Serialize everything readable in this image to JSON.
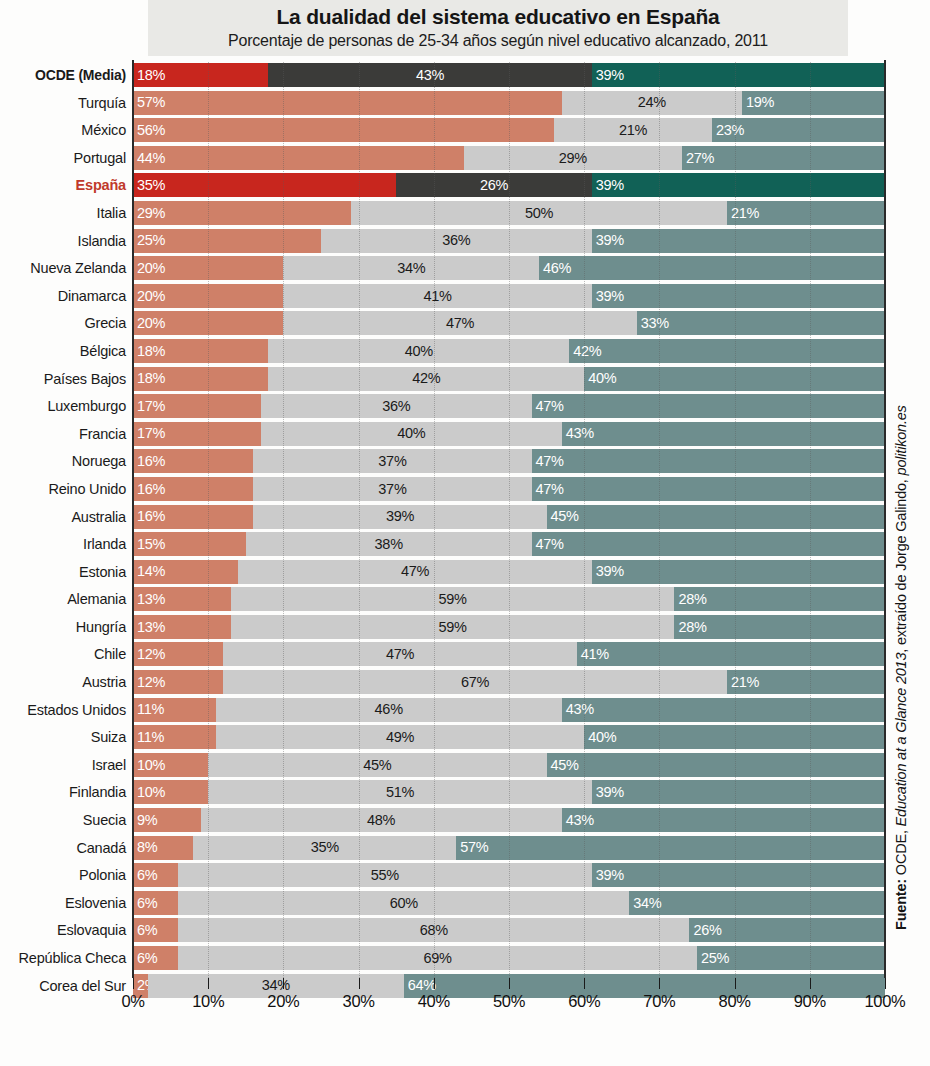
{
  "header": {
    "title": "La dualidad del sistema educativo en España",
    "subtitle": "Porcentaje de personas de 25-34 años según nivel educativo alcanzado, 2011"
  },
  "source": {
    "prefix": "Fuente:",
    "org": "OCDE,",
    "publication": "Education at a Glance 2013",
    "middle": ", extraído de Jorge Galindo,",
    "site": "politikon.es"
  },
  "axis": {
    "ticks": [
      "0%",
      "10%",
      "20%",
      "30%",
      "40%",
      "50%",
      "60%",
      "70%",
      "80%",
      "90%",
      "100%"
    ],
    "min": 0,
    "max": 100
  },
  "colors": {
    "seg1_normal": "#cf8068",
    "seg2_normal": "#cbcbcb",
    "seg3_normal": "#6e8e8e",
    "seg1_highlight": "#c8261e",
    "seg2_highlight": "#3b3b39",
    "seg3_highlight": "#116156",
    "spain_label": "#c0392b",
    "title_band": "#e9e9e6"
  },
  "chart_data": {
    "type": "bar",
    "orientation": "horizontal",
    "stacked": true,
    "title": "La dualidad del sistema educativo en España",
    "subtitle": "Porcentaje de personas de 25-34 años según nivel educativo alcanzado, 2011",
    "xlabel": "",
    "ylabel": "",
    "xlim": [
      0,
      100
    ],
    "grid": true,
    "legend": null,
    "series": [
      {
        "name": "Por debajo de secundaria",
        "color": "#cf8068"
      },
      {
        "name": "Secundaria",
        "color": "#cbcbcb"
      },
      {
        "name": "Terciaria",
        "color": "#6e8e8e"
      }
    ],
    "categories": [
      "OCDE (Media)",
      "Turquía",
      "México",
      "Portugal",
      "España",
      "Italia",
      "Islandia",
      "Nueva Zelanda",
      "Dinamarca",
      "Grecia",
      "Bélgica",
      "Países Bajos",
      "Luxemburgo",
      "Francia",
      "Noruega",
      "Reino Unido",
      "Australia",
      "Irlanda",
      "Estonia",
      "Alemania",
      "Hungría",
      "Chile",
      "Austria",
      "Estados Unidos",
      "Suiza",
      "Israel",
      "Finlandia",
      "Suecia",
      "Canadá",
      "Polonia",
      "Eslovenia",
      "Eslovaquia",
      "República Checa",
      "Corea del Sur"
    ],
    "rows": [
      {
        "label": "OCDE (Media)",
        "style": "bold",
        "highlight": true,
        "values": [
          18,
          43,
          39
        ],
        "labels": [
          "18%",
          "43%",
          "39%"
        ]
      },
      {
        "label": "Turquía",
        "style": "normal",
        "highlight": false,
        "values": [
          57,
          24,
          19
        ],
        "labels": [
          "57%",
          "24%",
          "19%"
        ]
      },
      {
        "label": "México",
        "style": "normal",
        "highlight": false,
        "values": [
          56,
          21,
          23
        ],
        "labels": [
          "56%",
          "21%",
          "23%"
        ]
      },
      {
        "label": "Portugal",
        "style": "normal",
        "highlight": false,
        "values": [
          44,
          29,
          27
        ],
        "labels": [
          "44%",
          "29%",
          "27%"
        ]
      },
      {
        "label": "España",
        "style": "spain",
        "highlight": true,
        "values": [
          35,
          26,
          39
        ],
        "labels": [
          "35%",
          "26%",
          "39%"
        ]
      },
      {
        "label": "Italia",
        "style": "normal",
        "highlight": false,
        "values": [
          29,
          50,
          21
        ],
        "labels": [
          "29%",
          "50%",
          "21%"
        ]
      },
      {
        "label": "Islandia",
        "style": "normal",
        "highlight": false,
        "values": [
          25,
          36,
          39
        ],
        "labels": [
          "25%",
          "36%",
          "39%"
        ]
      },
      {
        "label": "Nueva Zelanda",
        "style": "normal",
        "highlight": false,
        "values": [
          20,
          34,
          46
        ],
        "labels": [
          "20%",
          "34%",
          "46%"
        ]
      },
      {
        "label": "Dinamarca",
        "style": "normal",
        "highlight": false,
        "values": [
          20,
          41,
          39
        ],
        "labels": [
          "20%",
          "41%",
          "39%"
        ]
      },
      {
        "label": "Grecia",
        "style": "normal",
        "highlight": false,
        "values": [
          20,
          47,
          33
        ],
        "labels": [
          "20%",
          "47%",
          "33%"
        ]
      },
      {
        "label": "Bélgica",
        "style": "normal",
        "highlight": false,
        "values": [
          18,
          40,
          42
        ],
        "labels": [
          "18%",
          "40%",
          "42%"
        ]
      },
      {
        "label": "Países Bajos",
        "style": "normal",
        "highlight": false,
        "values": [
          18,
          42,
          40
        ],
        "labels": [
          "18%",
          "42%",
          "40%"
        ]
      },
      {
        "label": "Luxemburgo",
        "style": "normal",
        "highlight": false,
        "values": [
          17,
          36,
          47
        ],
        "labels": [
          "17%",
          "36%",
          "47%"
        ]
      },
      {
        "label": "Francia",
        "style": "normal",
        "highlight": false,
        "values": [
          17,
          40,
          43
        ],
        "labels": [
          "17%",
          "40%",
          "43%"
        ]
      },
      {
        "label": "Noruega",
        "style": "normal",
        "highlight": false,
        "values": [
          16,
          37,
          47
        ],
        "labels": [
          "16%",
          "37%",
          "47%"
        ]
      },
      {
        "label": "Reino Unido",
        "style": "normal",
        "highlight": false,
        "values": [
          16,
          37,
          47
        ],
        "labels": [
          "16%",
          "37%",
          "47%"
        ]
      },
      {
        "label": "Australia",
        "style": "normal",
        "highlight": false,
        "values": [
          16,
          39,
          45
        ],
        "labels": [
          "16%",
          "39%",
          "45%"
        ]
      },
      {
        "label": "Irlanda",
        "style": "normal",
        "highlight": false,
        "values": [
          15,
          38,
          47
        ],
        "labels": [
          "15%",
          "38%",
          "47%"
        ]
      },
      {
        "label": "Estonia",
        "style": "normal",
        "highlight": false,
        "values": [
          14,
          47,
          39
        ],
        "labels": [
          "14%",
          "47%",
          "39%"
        ]
      },
      {
        "label": "Alemania",
        "style": "normal",
        "highlight": false,
        "values": [
          13,
          59,
          28
        ],
        "labels": [
          "13%",
          "59%",
          "28%"
        ]
      },
      {
        "label": "Hungría",
        "style": "normal",
        "highlight": false,
        "values": [
          13,
          59,
          28
        ],
        "labels": [
          "13%",
          "59%",
          "28%"
        ]
      },
      {
        "label": "Chile",
        "style": "normal",
        "highlight": false,
        "values": [
          12,
          47,
          41
        ],
        "labels": [
          "12%",
          "47%",
          "41%"
        ]
      },
      {
        "label": "Austria",
        "style": "normal",
        "highlight": false,
        "values": [
          12,
          67,
          21
        ],
        "labels": [
          "12%",
          "67%",
          "21%"
        ]
      },
      {
        "label": "Estados Unidos",
        "style": "normal",
        "highlight": false,
        "values": [
          11,
          46,
          43
        ],
        "labels": [
          "11%",
          "46%",
          "43%"
        ]
      },
      {
        "label": "Suiza",
        "style": "normal",
        "highlight": false,
        "values": [
          11,
          49,
          40
        ],
        "labels": [
          "11%",
          "49%",
          "40%"
        ]
      },
      {
        "label": "Israel",
        "style": "normal",
        "highlight": false,
        "values": [
          10,
          45,
          45
        ],
        "labels": [
          "10%",
          "45%",
          "45%"
        ]
      },
      {
        "label": "Finlandia",
        "style": "normal",
        "highlight": false,
        "values": [
          10,
          51,
          39
        ],
        "labels": [
          "10%",
          "51%",
          "39%"
        ]
      },
      {
        "label": "Suecia",
        "style": "normal",
        "highlight": false,
        "values": [
          9,
          48,
          43
        ],
        "labels": [
          "9%",
          "48%",
          "43%"
        ]
      },
      {
        "label": "Canadá",
        "style": "normal",
        "highlight": false,
        "values": [
          8,
          35,
          57
        ],
        "labels": [
          "8%",
          "35%",
          "57%"
        ]
      },
      {
        "label": "Polonia",
        "style": "normal",
        "highlight": false,
        "values": [
          6,
          55,
          39
        ],
        "labels": [
          "6%",
          "55%",
          "39%"
        ]
      },
      {
        "label": "Eslovenia",
        "style": "normal",
        "highlight": false,
        "values": [
          6,
          60,
          34
        ],
        "labels": [
          "6%",
          "60%",
          "34%"
        ]
      },
      {
        "label": "Eslovaquia",
        "style": "normal",
        "highlight": false,
        "values": [
          6,
          68,
          26
        ],
        "labels": [
          "6%",
          "68%",
          "26%"
        ]
      },
      {
        "label": "República Checa",
        "style": "normal",
        "highlight": false,
        "values": [
          6,
          69,
          25
        ],
        "labels": [
          "6%",
          "69%",
          "25%"
        ]
      },
      {
        "label": "Corea del Sur",
        "style": "normal",
        "highlight": false,
        "values": [
          2,
          34,
          64
        ],
        "labels": [
          "2%",
          "34%",
          "64%"
        ]
      }
    ]
  }
}
